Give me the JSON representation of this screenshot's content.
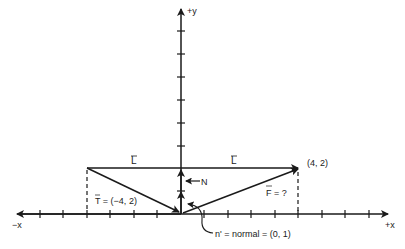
{
  "axes": {
    "x_pos_label": "+x",
    "x_neg_label": "−x",
    "y_pos_label": "+y"
  },
  "vectors": {
    "L_left_label": "L",
    "L_right_label": "L",
    "T_label": "T",
    "T_value": "= (−4, 2)",
    "F_label": "F",
    "F_value": "= ?",
    "N_label": "N",
    "normal_annotation": "n' = normal = (0, 1)",
    "point_label": "(4, 2)"
  },
  "colors": {
    "ink": "#1a1a1a",
    "background": "#ffffff"
  }
}
